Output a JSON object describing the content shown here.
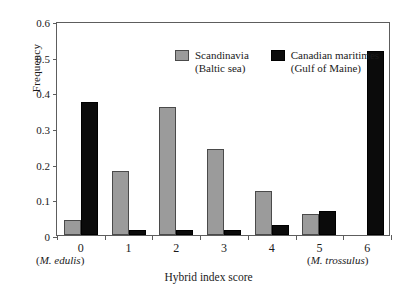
{
  "chart_data": {
    "type": "bar",
    "title": "",
    "xlabel": "Hybrid index score",
    "ylabel": "Frequency",
    "categories": [
      "0",
      "1",
      "2",
      "3",
      "4",
      "5",
      "6"
    ],
    "ylim": [
      0,
      0.6
    ],
    "yticks": [
      "0",
      "0.1",
      "0.2",
      "0.3",
      "0.4",
      "0.5",
      "0.6"
    ],
    "ytick_values": [
      0,
      0.1,
      0.2,
      0.3,
      0.4,
      0.5,
      0.6
    ],
    "grid": false,
    "legend_position": "top-center",
    "series": [
      {
        "name": "Scandinavia",
        "sublabel": "(Baltic sea)",
        "color": "#9b9b9b",
        "values": [
          0.042,
          0.18,
          0.359,
          0.24,
          0.123,
          0.059,
          0.0
        ]
      },
      {
        "name": "Canadian maritimes",
        "sublabel": "(Gulf of Maine)",
        "color": "#0b0b0b",
        "values": [
          0.373,
          0.013,
          0.015,
          0.015,
          0.027,
          0.067,
          0.515
        ]
      }
    ],
    "annotations": [
      {
        "text": "(M. edulis)",
        "position": "below-axis-left"
      },
      {
        "text": "(M. trossulus)",
        "position": "below-axis-right"
      }
    ]
  },
  "axis": {
    "y_label": "Frequency",
    "x_title": "Hybrid index score"
  },
  "species_labels": {
    "left_open": "(",
    "left": "M. edulis",
    "left_close": ")",
    "right_open": "(",
    "right": "M. trossulus",
    "right_close": ")"
  },
  "legend": {
    "items": [
      {
        "label": "Scandinavia",
        "sublabel": "(Baltic sea)"
      },
      {
        "label": "Canadian maritimes",
        "sublabel": "(Gulf of Maine)"
      }
    ]
  }
}
